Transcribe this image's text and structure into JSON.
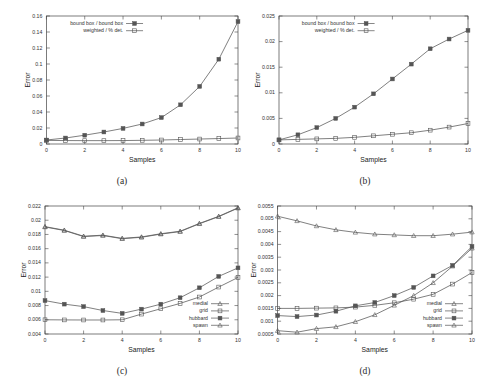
{
  "figure": {
    "background": "#ffffff",
    "axis_color": "#444444",
    "series_color": "#555555",
    "tick_font_px": 4.2,
    "label_font_px": 6.0,
    "legend_font_px": 4.2
  },
  "panels": [
    {
      "id": "a",
      "caption": "(a)",
      "xlabel": "Samples",
      "ylabel": "Error",
      "xticks": [
        0,
        2,
        4,
        6,
        8,
        10
      ],
      "xtick_labels": [
        "0",
        "2",
        "4",
        "6",
        "8",
        "10"
      ],
      "yticks": [
        0,
        0.02,
        0.04,
        0.06,
        0.08,
        0.1,
        0.12,
        0.14,
        0.16
      ],
      "ytick_labels": [
        "0",
        "0.02",
        "0.04",
        "0.06",
        "0.08",
        "0.1",
        "0.12",
        "0.14",
        "0.16"
      ],
      "xlim": [
        0,
        10
      ],
      "ylim": [
        0,
        0.16
      ],
      "legend_position": "upper-left",
      "legend": [
        {
          "label": "bound box / bound box",
          "marker": "filled-square"
        },
        {
          "label": "weighted / % det.",
          "marker": "open-square"
        }
      ]
    },
    {
      "id": "b",
      "caption": "(b)",
      "xlabel": "Samples",
      "ylabel": "Error",
      "xticks": [
        0,
        2,
        4,
        6,
        8,
        10
      ],
      "xtick_labels": [
        "0",
        "2",
        "4",
        "6",
        "8",
        "10"
      ],
      "yticks": [
        0,
        0.005,
        0.01,
        0.015,
        0.02,
        0.025
      ],
      "ytick_labels": [
        "0",
        "0.005",
        "0.01",
        "0.015",
        "0.02",
        "0.025"
      ],
      "xlim": [
        0,
        10
      ],
      "ylim": [
        0,
        0.025
      ],
      "legend_position": "upper-left",
      "legend": [
        {
          "label": "bound box / bound box",
          "marker": "filled-square"
        },
        {
          "label": "weighted / % det.",
          "marker": "open-square"
        }
      ]
    },
    {
      "id": "c",
      "caption": "(c)",
      "xlabel": "Samples",
      "ylabel": "Error",
      "xticks": [
        0,
        2,
        4,
        6,
        8,
        10
      ],
      "xtick_labels": [
        "0",
        "2",
        "4",
        "6",
        "8",
        "10"
      ],
      "yticks": [
        0.004,
        0.006,
        0.008,
        0.01,
        0.012,
        0.014,
        0.016,
        0.018,
        0.02,
        0.022
      ],
      "ytick_labels": [
        "0.004",
        "0.006",
        "0.008",
        "0.01",
        "0.012",
        "0.014",
        "0.016",
        "0.018",
        "0.02",
        "0.022"
      ],
      "xlim": [
        0,
        10
      ],
      "ylim": [
        0.004,
        0.022
      ],
      "legend_position": "lower-right",
      "legend": [
        {
          "label": "medial",
          "marker": "triangle"
        },
        {
          "label": "grid",
          "marker": "open-square"
        },
        {
          "label": "hubbard",
          "marker": "filled-square"
        },
        {
          "label": "spawn",
          "marker": "triangle"
        }
      ]
    },
    {
      "id": "d",
      "caption": "(d)",
      "xlabel": "Samples",
      "ylabel": "Error",
      "xticks": [
        0,
        2,
        4,
        6,
        8,
        10
      ],
      "xtick_labels": [
        "0",
        "2",
        "4",
        "6",
        "8",
        "10"
      ],
      "yticks": [
        0.0005,
        0.001,
        0.0015,
        0.002,
        0.0025,
        0.003,
        0.0035,
        0.004,
        0.0045,
        0.005,
        0.0055
      ],
      "ytick_labels": [
        "0.0005",
        "0.001",
        "0.0015",
        "0.002",
        "0.0025",
        "0.003",
        "0.0035",
        "0.004",
        "0.0045",
        "0.005",
        "0.0055"
      ],
      "xlim": [
        0,
        10
      ],
      "ylim": [
        0.0005,
        0.0055
      ],
      "legend_position": "lower-right",
      "legend": [
        {
          "label": "medial",
          "marker": "triangle"
        },
        {
          "label": "grid",
          "marker": "open-square"
        },
        {
          "label": "hubbard",
          "marker": "filled-square"
        },
        {
          "label": "spawn",
          "marker": "triangle"
        }
      ]
    }
  ],
  "chart_data": [
    {
      "type": "line",
      "panel": "a",
      "title": "(a)",
      "xlabel": "Samples",
      "ylabel": "Error",
      "xlim": [
        0,
        10
      ],
      "ylim": [
        0,
        0.16
      ],
      "grid": false,
      "legend_position": "upper-left",
      "x": [
        0,
        1,
        2,
        3,
        4,
        5,
        6,
        7,
        8,
        9,
        10
      ],
      "series": [
        {
          "name": "bound box / bound box",
          "marker": "filled-square",
          "values": [
            0.005,
            0.0075,
            0.011,
            0.015,
            0.0195,
            0.025,
            0.033,
            0.049,
            0.072,
            0.106,
            0.153
          ]
        },
        {
          "name": "weighted / % det.",
          "marker": "open-square",
          "values": [
            0.0045,
            0.0043,
            0.0042,
            0.0042,
            0.0043,
            0.0046,
            0.005,
            0.0056,
            0.0062,
            0.0068,
            0.0075
          ]
        }
      ]
    },
    {
      "type": "line",
      "panel": "b",
      "title": "(b)",
      "xlabel": "Samples",
      "ylabel": "Error",
      "xlim": [
        0,
        10
      ],
      "ylim": [
        0,
        0.025
      ],
      "grid": false,
      "legend_position": "upper-left",
      "x": [
        0,
        1,
        2,
        3,
        4,
        5,
        6,
        7,
        8,
        9,
        10
      ],
      "series": [
        {
          "name": "bound box / bound box",
          "marker": "filled-square",
          "values": [
            0.0008,
            0.0018,
            0.0032,
            0.005,
            0.0072,
            0.0098,
            0.0127,
            0.0156,
            0.0186,
            0.0205,
            0.0222
          ]
        },
        {
          "name": "weighted / % det.",
          "marker": "open-square",
          "values": [
            0.0008,
            0.0009,
            0.001,
            0.0011,
            0.0013,
            0.0016,
            0.0019,
            0.0022,
            0.0027,
            0.0033,
            0.004
          ]
        }
      ]
    },
    {
      "type": "line",
      "panel": "c",
      "title": "(c)",
      "xlabel": "Samples",
      "ylabel": "Error",
      "xlim": [
        0,
        10
      ],
      "ylim": [
        0.004,
        0.022
      ],
      "grid": false,
      "legend_position": "lower-right",
      "x": [
        0,
        1,
        2,
        3,
        4,
        5,
        6,
        7,
        8,
        9,
        10
      ],
      "series": [
        {
          "name": "medial",
          "marker": "triangle",
          "values": [
            0.0191,
            0.0186,
            0.01775,
            0.0179,
            0.01745,
            0.01765,
            0.0181,
            0.01845,
            0.01955,
            0.02055,
            0.02175
          ]
        },
        {
          "name": "grid",
          "marker": "open-square",
          "values": [
            0.006,
            0.00598,
            0.00597,
            0.00597,
            0.006,
            0.0068,
            0.00755,
            0.0083,
            0.0092,
            0.0106,
            0.01195
          ]
        },
        {
          "name": "hubbard",
          "marker": "filled-square",
          "values": [
            0.0087,
            0.0082,
            0.00785,
            0.0073,
            0.0069,
            0.0075,
            0.0082,
            0.0091,
            0.0105,
            0.0121,
            0.0133
          ]
        },
        {
          "name": "spawn",
          "marker": "triangle",
          "values": [
            0.01905,
            0.01855,
            0.0177,
            0.01785,
            0.0174,
            0.0176,
            0.01805,
            0.0184,
            0.0195,
            0.0205,
            0.0217
          ]
        }
      ]
    },
    {
      "type": "line",
      "panel": "d",
      "title": "(d)",
      "xlabel": "Samples",
      "ylabel": "Error",
      "xlim": [
        0.0005,
        0.0055
      ],
      "ylim": [
        0.0005,
        0.0055
      ],
      "grid": false,
      "legend_position": "lower-right",
      "x": [
        0,
        1,
        2,
        3,
        4,
        5,
        6,
        7,
        8,
        9,
        10
      ],
      "series": [
        {
          "name": "medial",
          "marker": "triangle",
          "values": [
            0.0051,
            0.00492,
            0.00472,
            0.00457,
            0.00447,
            0.0044,
            0.00437,
            0.00434,
            0.00434,
            0.0044,
            0.00448
          ]
        },
        {
          "name": "grid",
          "marker": "open-square",
          "values": [
            0.0015,
            0.0015,
            0.00151,
            0.00152,
            0.00155,
            0.00162,
            0.00172,
            0.00186,
            0.00205,
            0.00245,
            0.0029
          ]
        },
        {
          "name": "hubbard",
          "marker": "filled-square",
          "values": [
            0.00122,
            0.00118,
            0.00124,
            0.00139,
            0.0016,
            0.00173,
            0.002,
            0.00232,
            0.00277,
            0.00318,
            0.00392
          ]
        },
        {
          "name": "spawn",
          "marker": "triangle",
          "values": [
            0.00063,
            0.00057,
            0.00071,
            0.00078,
            0.00098,
            0.00125,
            0.00162,
            0.002,
            0.0025,
            0.00315,
            0.00385
          ]
        }
      ]
    }
  ]
}
